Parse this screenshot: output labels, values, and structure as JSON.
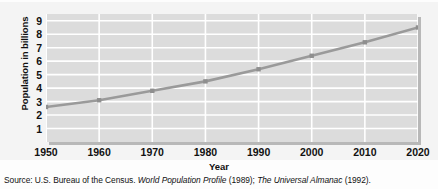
{
  "chart_data": {
    "type": "line",
    "title": "",
    "subtitle": "",
    "xlabel": "Year",
    "ylabel": "Population in billions",
    "x": [
      1950,
      1960,
      1970,
      1980,
      1990,
      2000,
      2010,
      2020
    ],
    "values": [
      2.6,
      3.1,
      3.8,
      4.5,
      5.4,
      6.4,
      7.4,
      8.5
    ],
    "series": [
      {
        "name": "World population",
        "values": [
          2.6,
          3.1,
          3.8,
          4.5,
          5.4,
          6.4,
          7.4,
          8.5
        ]
      }
    ],
    "xlim": [
      1950,
      2020
    ],
    "ylim": [
      0,
      9.5
    ],
    "x_ticks": [
      "1950",
      "1960",
      "1970",
      "1980",
      "1990",
      "2000",
      "2010",
      "2020"
    ],
    "y_ticks": [
      "1",
      "2",
      "3",
      "4",
      "5",
      "6",
      "7",
      "8",
      "9"
    ],
    "y_tick_values": [
      1,
      2,
      3,
      4,
      5,
      6,
      7,
      8,
      9
    ],
    "grid": true,
    "grid_orientation": "both",
    "legend": false,
    "legend_position": "none",
    "marker": "square",
    "line_color": "#9a9a9a",
    "plot_background": "#dcdcdc",
    "grid_color": "#ffffff",
    "text_color": "#111111",
    "annotations": []
  },
  "source": {
    "prefix": "Source: U.S. Bureau of the Census.",
    "work1": "World Population  Profile",
    "work1_year": "(1989);",
    "work2": "The Universal Almanac",
    "work2_year": "(1992)."
  }
}
